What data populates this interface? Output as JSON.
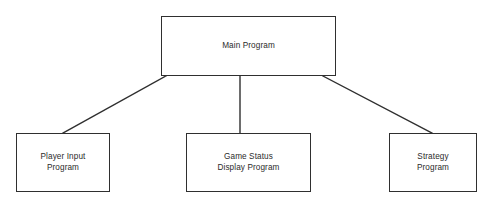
{
  "diagram": {
    "type": "hierarchy-tree",
    "background_color": "#ffffff",
    "line_color": "#2f2f2f",
    "text_color": "#2b2b2b",
    "nodes": [
      {
        "id": "main",
        "label": "Main Program",
        "level": 0,
        "x": 161,
        "y": 16,
        "width": 175,
        "height": 60
      },
      {
        "id": "player_input",
        "label": "Player Input\nProgram",
        "level": 1,
        "x": 16,
        "y": 133,
        "width": 94,
        "height": 59
      },
      {
        "id": "game_status",
        "label": "Game Status\nDisplay Program",
        "level": 1,
        "x": 186,
        "y": 133,
        "width": 125,
        "height": 59
      },
      {
        "id": "strategy",
        "label": "Strategy\nProgram",
        "level": 1,
        "x": 389,
        "y": 133,
        "width": 88,
        "height": 59
      }
    ],
    "edges": [
      {
        "id": "main-to-player-input",
        "from": "main",
        "to": "player_input",
        "x1": 166,
        "y1": 76,
        "x2": 63,
        "y2": 133
      },
      {
        "id": "main-to-game-status",
        "from": "main",
        "to": "game_status",
        "x1": 240,
        "y1": 76,
        "x2": 240,
        "y2": 133
      },
      {
        "id": "main-to-strategy",
        "from": "main",
        "to": "strategy",
        "x1": 323,
        "y1": 76,
        "x2": 432,
        "y2": 133
      }
    ]
  }
}
